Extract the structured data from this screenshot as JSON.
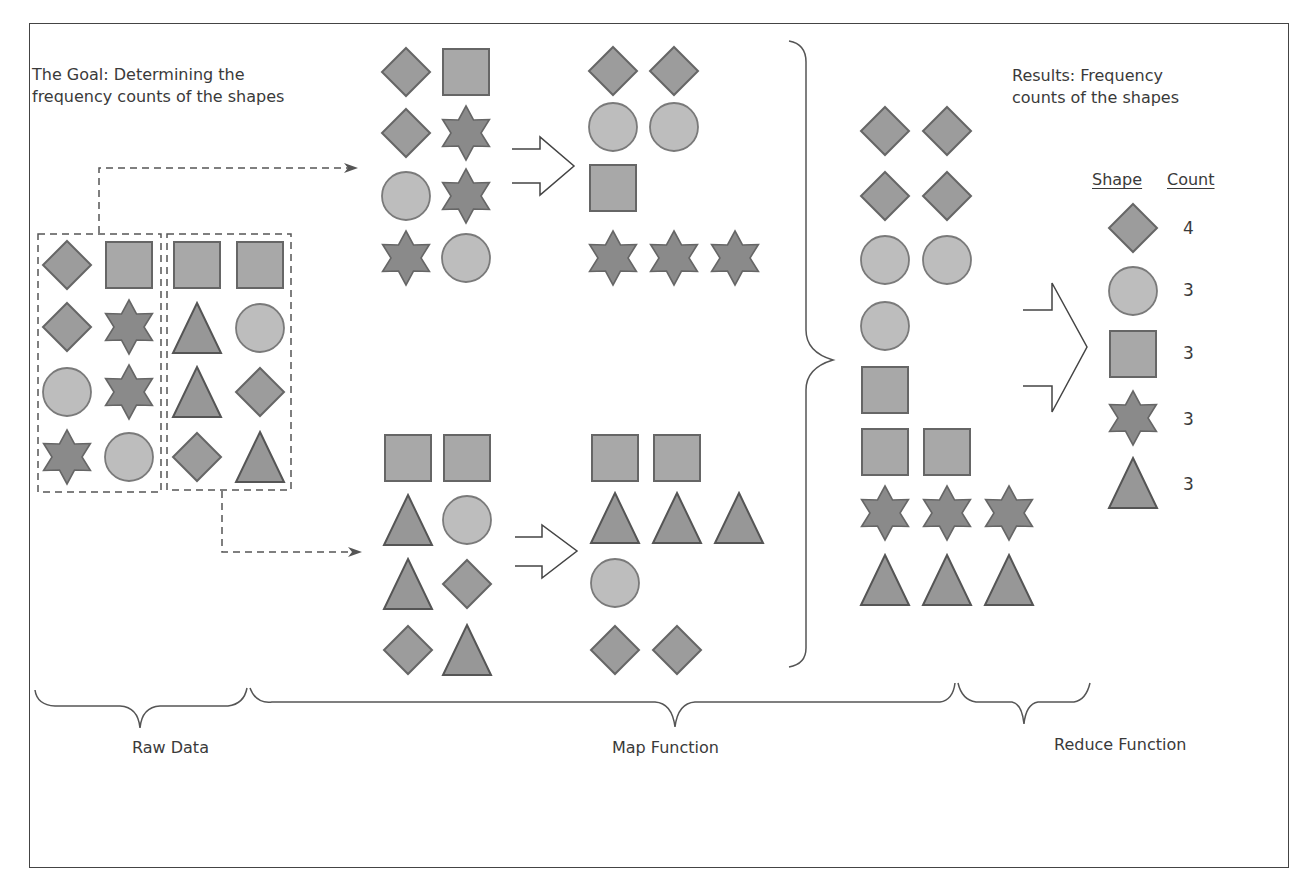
{
  "colors": {
    "diamond": "#9c9c9c",
    "square": "#a8a8a8",
    "circle": "#bdbdbd",
    "star": "#8a8a8a",
    "triangle": "#979797",
    "outline": "#666666",
    "line": "#555555"
  },
  "goal": {
    "line1": "The Goal: Determining the",
    "line2": "frequency counts of the shapes"
  },
  "results": {
    "line1": "Results: Frequency",
    "line2": "counts of the shapes",
    "header_shape": "Shape",
    "header_count": "Count",
    "rows": [
      {
        "shape": "diamond",
        "count": "4"
      },
      {
        "shape": "circle",
        "count": "3"
      },
      {
        "shape": "square",
        "count": "3"
      },
      {
        "shape": "star",
        "count": "3"
      },
      {
        "shape": "triangle",
        "count": "3"
      }
    ]
  },
  "stages": {
    "raw_data": "Raw Data",
    "map_function": "Map Function",
    "reduce_function": "Reduce Function"
  },
  "raw_data": {
    "group1": [
      [
        "diamond",
        "square"
      ],
      [
        "diamond",
        "star"
      ],
      [
        "circle",
        "star"
      ],
      [
        "star",
        "circle"
      ]
    ],
    "group2": [
      [
        "square",
        "square"
      ],
      [
        "triangle",
        "circle"
      ],
      [
        "triangle",
        "diamond"
      ],
      [
        "diamond",
        "triangle"
      ]
    ]
  },
  "map": {
    "top_input": [
      [
        "diamond",
        "square"
      ],
      [
        "diamond",
        "star"
      ],
      [
        "circle",
        "star"
      ],
      [
        "star",
        "circle"
      ]
    ],
    "top_output": [
      [
        "diamond",
        "diamond"
      ],
      [
        "circle",
        "circle"
      ],
      [
        "square"
      ],
      [
        "star",
        "star",
        "star"
      ]
    ],
    "bottom_input": [
      [
        "square",
        "square"
      ],
      [
        "triangle",
        "circle"
      ],
      [
        "triangle",
        "diamond"
      ],
      [
        "diamond",
        "triangle"
      ]
    ],
    "bottom_output": [
      [
        "square",
        "square"
      ],
      [
        "triangle",
        "triangle",
        "triangle"
      ],
      [
        "circle"
      ],
      [
        "diamond",
        "diamond"
      ]
    ]
  },
  "reduce_input": [
    [
      "diamond",
      "diamond"
    ],
    [
      "diamond",
      "diamond"
    ],
    [
      "circle",
      "circle"
    ],
    [
      "circle"
    ],
    [
      "square"
    ],
    [
      "square",
      "square"
    ],
    [
      "star",
      "star",
      "star"
    ],
    [
      "triangle",
      "triangle",
      "triangle"
    ]
  ]
}
